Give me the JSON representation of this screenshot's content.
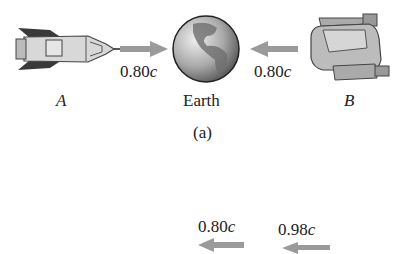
{
  "figure": {
    "panel_a": {
      "caption": "(a)",
      "objects": [
        {
          "name": "rocket",
          "label": "A",
          "speed": "0.80",
          "speed_unit": "c",
          "direction": "right"
        },
        {
          "name": "earth",
          "label": "Earth"
        },
        {
          "name": "spaceship",
          "label": "B",
          "speed": "0.80",
          "speed_unit": "c",
          "direction": "left"
        }
      ]
    },
    "panel_b": {
      "arrows": [
        {
          "speed": "0.80",
          "speed_unit": "c",
          "direction": "left"
        },
        {
          "speed": "0.98",
          "speed_unit": "c",
          "direction": "left"
        }
      ]
    },
    "colors": {
      "arrow": "#9a9a9a",
      "text": "#222222",
      "background": "#ffffff"
    }
  }
}
